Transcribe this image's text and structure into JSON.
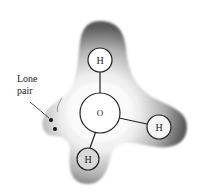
{
  "figure": {
    "label": {
      "line1": "Lone",
      "line2": "pair"
    },
    "atoms": {
      "center": {
        "symbol": "O"
      },
      "top": {
        "symbol": "H"
      },
      "right": {
        "symbol": "H"
      },
      "bottom": {
        "symbol": "H"
      }
    },
    "colors": {
      "cloud_dark": "#5a5a5a",
      "cloud_light": "#f4f4f4",
      "outline": "#222222"
    }
  }
}
